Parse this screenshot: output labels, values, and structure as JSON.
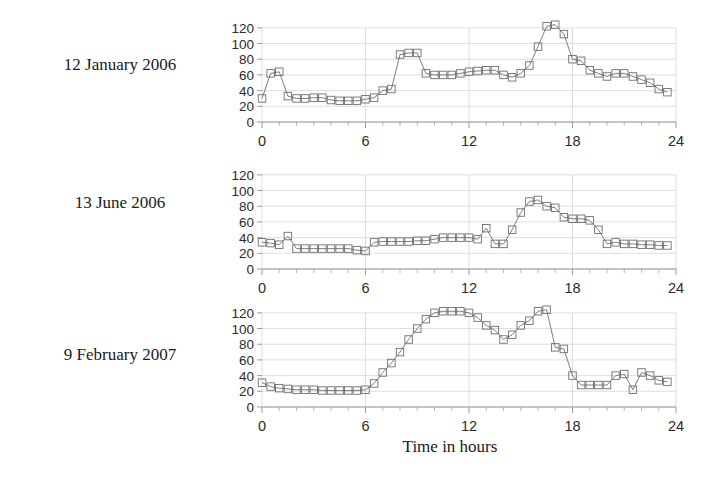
{
  "figure": {
    "xlabel": "Time in hours",
    "background": "#ffffff",
    "line_color": "#6f6f6f",
    "marker_color": "#6f6f6f",
    "grid_color": "#cfcfd8",
    "axis_color": "#9a9aa2",
    "text_color": "#1a1a1a"
  },
  "axes": {
    "y_ticks": [
      0,
      20,
      40,
      60,
      80,
      100,
      120
    ],
    "x_ticks": [
      0,
      6,
      12,
      18,
      24
    ],
    "x_minor_step": 1,
    "ylim": [
      0,
      130
    ],
    "xlim": [
      0,
      24
    ]
  },
  "panels": [
    {
      "label": "12 January 2006",
      "chart_data": {
        "type": "line",
        "title": "12 January 2006",
        "xlabel": "Time in hours",
        "ylabel": "",
        "xlim": [
          0,
          24
        ],
        "ylim": [
          0,
          130
        ],
        "grid": true,
        "marker": "square",
        "x": [
          0.0,
          0.5,
          1.0,
          1.5,
          2.0,
          2.5,
          3.0,
          3.5,
          4.0,
          4.5,
          5.0,
          5.5,
          6.0,
          6.5,
          7.0,
          7.5,
          8.0,
          8.5,
          9.0,
          9.5,
          10.0,
          10.5,
          11.0,
          11.5,
          12.0,
          12.5,
          13.0,
          13.5,
          14.0,
          14.5,
          15.0,
          15.5,
          16.0,
          16.5,
          17.0,
          17.5,
          18.0,
          18.5,
          19.0,
          19.5,
          20.0,
          20.5,
          21.0,
          21.5,
          22.0,
          22.5,
          23.0,
          23.5
        ],
        "y": [
          30,
          62,
          64,
          33,
          30,
          30,
          31,
          31,
          28,
          27,
          27,
          27,
          29,
          31,
          40,
          42,
          86,
          88,
          88,
          62,
          60,
          60,
          60,
          62,
          64,
          65,
          66,
          66,
          60,
          57,
          62,
          72,
          96,
          122,
          124,
          112,
          80,
          78,
          66,
          62,
          58,
          62,
          62,
          58,
          54,
          50,
          42,
          38
        ]
      }
    },
    {
      "label": "13 June 2006",
      "chart_data": {
        "type": "line",
        "title": "13 June 2006",
        "xlabel": "Time in hours",
        "ylabel": "",
        "xlim": [
          0,
          24
        ],
        "ylim": [
          0,
          130
        ],
        "grid": true,
        "marker": "square",
        "x": [
          0.0,
          0.5,
          1.0,
          1.5,
          2.0,
          2.5,
          3.0,
          3.5,
          4.0,
          4.5,
          5.0,
          5.5,
          6.0,
          6.5,
          7.0,
          7.5,
          8.0,
          8.5,
          9.0,
          9.5,
          10.0,
          10.5,
          11.0,
          11.5,
          12.0,
          12.5,
          13.0,
          13.5,
          14.0,
          14.5,
          15.0,
          15.5,
          16.0,
          16.5,
          17.0,
          17.5,
          18.0,
          18.5,
          19.0,
          19.5,
          20.0,
          20.5,
          21.0,
          21.5,
          22.0,
          22.5,
          23.0,
          23.5
        ],
        "y": [
          34,
          33,
          31,
          42,
          26,
          26,
          26,
          26,
          26,
          26,
          26,
          24,
          23,
          34,
          35,
          35,
          35,
          35,
          36,
          36,
          38,
          40,
          40,
          40,
          40,
          38,
          52,
          32,
          32,
          50,
          72,
          86,
          88,
          80,
          78,
          66,
          64,
          64,
          62,
          50,
          32,
          34,
          32,
          32,
          31,
          31,
          30,
          30
        ]
      }
    },
    {
      "label": "9 February 2007",
      "chart_data": {
        "type": "line",
        "title": "9 February 2007",
        "xlabel": "Time in hours",
        "ylabel": "",
        "xlim": [
          0,
          24
        ],
        "ylim": [
          0,
          130
        ],
        "grid": true,
        "marker": "square",
        "x": [
          0.0,
          0.5,
          1.0,
          1.5,
          2.0,
          2.5,
          3.0,
          3.5,
          4.0,
          4.5,
          5.0,
          5.5,
          6.0,
          6.5,
          7.0,
          7.5,
          8.0,
          8.5,
          9.0,
          9.5,
          10.0,
          10.5,
          11.0,
          11.5,
          12.0,
          12.5,
          13.0,
          13.5,
          14.0,
          14.5,
          15.0,
          15.5,
          16.0,
          16.5,
          17.0,
          17.5,
          18.0,
          18.5,
          19.0,
          19.5,
          20.0,
          20.5,
          21.0,
          21.5,
          22.0,
          22.5,
          23.0,
          23.5
        ],
        "y": [
          31,
          26,
          24,
          23,
          22,
          22,
          22,
          21,
          21,
          21,
          21,
          21,
          22,
          30,
          44,
          56,
          70,
          86,
          100,
          112,
          120,
          122,
          122,
          122,
          120,
          114,
          104,
          98,
          86,
          92,
          104,
          110,
          122,
          124,
          76,
          74,
          40,
          28,
          28,
          28,
          28,
          40,
          42,
          22,
          44,
          40,
          34,
          32
        ]
      }
    }
  ]
}
